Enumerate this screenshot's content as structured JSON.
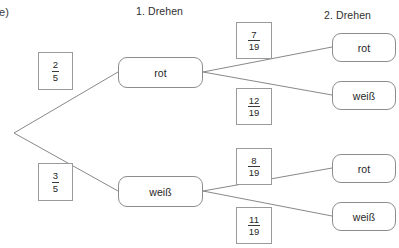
{
  "exercise": {
    "label": "e)"
  },
  "headers": {
    "stage1": "1. Drehen",
    "stage2": "2. Drehen"
  },
  "stage1": {
    "branches": [
      {
        "outcome": "rot",
        "prob_num": "2",
        "prob_den": "5"
      },
      {
        "outcome": "weiß",
        "prob_num": "3",
        "prob_den": "5"
      }
    ]
  },
  "stage2": {
    "from_rot": [
      {
        "outcome": "rot",
        "prob_num": "7",
        "prob_den": "19"
      },
      {
        "outcome": "weiß",
        "prob_num": "12",
        "prob_den": "19"
      }
    ],
    "from_weiss": [
      {
        "outcome": "rot",
        "prob_num": "8",
        "prob_den": "19"
      },
      {
        "outcome": "weiß",
        "prob_num": "11",
        "prob_den": "19"
      }
    ]
  },
  "style": {
    "line_color": "#7a7a7a",
    "node_border": "#8d8d8d",
    "box_border": "#9a9a9a",
    "text_color": "#262626"
  }
}
